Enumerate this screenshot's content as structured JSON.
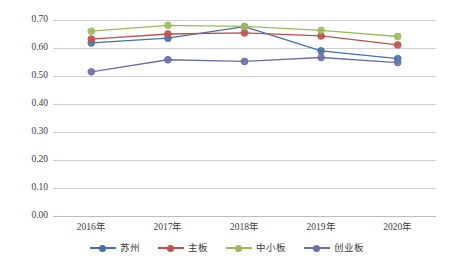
{
  "chart_data": {
    "type": "line",
    "title": "",
    "xlabel": "",
    "ylabel": "",
    "categories": [
      "2016年",
      "2017年",
      "2018年",
      "2019年",
      "2020年"
    ],
    "ylim": [
      0.0,
      0.7
    ],
    "ytick_labels": [
      "0.70",
      "0.60",
      "0.50",
      "0.40",
      "0.30",
      "0.20",
      "0.10",
      "0.00"
    ],
    "ytick_values": [
      0.7,
      0.6,
      0.5,
      0.4,
      0.3,
      0.2,
      0.1,
      0.0
    ],
    "grid": true,
    "legend_position": "bottom",
    "series": [
      {
        "name": "苏州",
        "color": "#4472a8",
        "values": [
          0.618,
          0.635,
          0.676,
          0.59,
          0.562
        ]
      },
      {
        "name": "主板",
        "color": "#c0504d",
        "values": [
          0.632,
          0.65,
          0.654,
          0.643,
          0.611
        ]
      },
      {
        "name": "中小板",
        "color": "#9bbb59",
        "values": [
          0.66,
          0.681,
          0.677,
          0.663,
          0.641
        ]
      },
      {
        "name": "创业板",
        "color": "#6b6fa8",
        "values": [
          0.515,
          0.558,
          0.552,
          0.566,
          0.548
        ]
      }
    ]
  },
  "axis": {
    "y_labels": [
      "0.70",
      "0.60",
      "0.50",
      "0.40",
      "0.30",
      "0.20",
      "0.10",
      "0.00"
    ],
    "x_labels": [
      "2016年",
      "2017年",
      "2018年",
      "2019年",
      "2020年"
    ]
  },
  "legend": {
    "items": [
      {
        "label": "苏州",
        "color": "#4472a8"
      },
      {
        "label": "主板",
        "color": "#c0504d"
      },
      {
        "label": "中小板",
        "color": "#9bbb59"
      },
      {
        "label": "创业板",
        "color": "#6b6fa8"
      }
    ]
  }
}
